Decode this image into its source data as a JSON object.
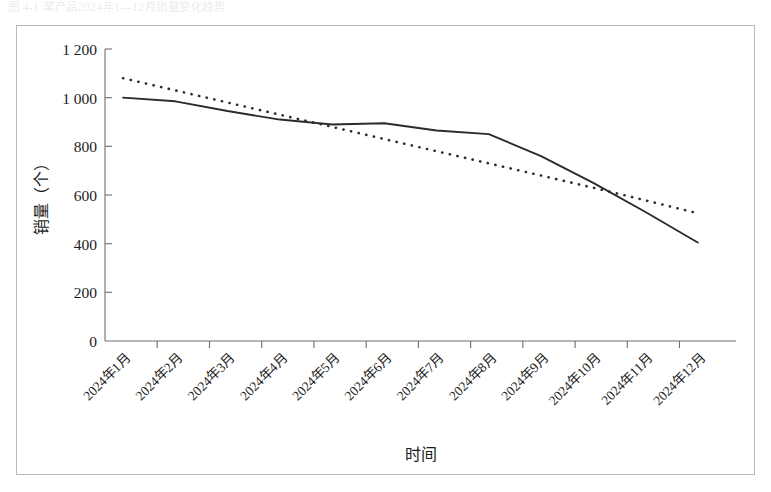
{
  "page": {
    "top_fragment": "图 4-1   某产品2024年1—12月销量变化趋势"
  },
  "chart_data": {
    "type": "line",
    "title": "",
    "xlabel": "时间",
    "ylabel": "销量（个）",
    "categories": [
      "2024年1月",
      "2024年2月",
      "2024年3月",
      "2024年4月",
      "2024年5月",
      "2024年6月",
      "2024年7月",
      "2024年8月",
      "2024年9月",
      "2024年10月",
      "2024年11月",
      "2024年12月"
    ],
    "series": [
      {
        "name": "销量",
        "style": "solid",
        "values": [
          1000,
          985,
          945,
          910,
          890,
          895,
          865,
          850,
          760,
          650,
          530,
          405
        ]
      },
      {
        "name": "线性（销量）",
        "style": "dotted",
        "values": [
          1080,
          1030,
          980,
          930,
          880,
          830,
          780,
          730,
          680,
          630,
          578,
          525
        ]
      }
    ],
    "ylim": [
      0,
      1200
    ],
    "yticks": [
      0,
      200,
      400,
      600,
      800,
      1000,
      1200
    ],
    "ytick_labels": [
      "0",
      "200",
      "400",
      "600",
      "800",
      "1 000",
      "1 200"
    ],
    "grid": false,
    "legend": "none",
    "xtick_rotation": 45
  },
  "colors": {
    "series": "#2b2b2e",
    "axis": "#6f6f73",
    "frame": "#b9b9bc",
    "background": "#ffffff"
  }
}
